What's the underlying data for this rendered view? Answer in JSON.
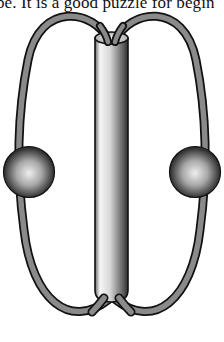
{
  "caption": {
    "text": "be. It is a good puzzle for begin"
  },
  "figure": {
    "elements": [
      {
        "name": "tube",
        "description": "vertical hollow cylinder"
      },
      {
        "name": "left-loop",
        "description": "string loop passing through tube"
      },
      {
        "name": "right-loop",
        "description": "string loop passing through tube"
      },
      {
        "name": "left-bead",
        "description": "sphere on left loop"
      },
      {
        "name": "right-bead",
        "description": "sphere on right loop"
      }
    ],
    "colors": {
      "background": "#ffffff",
      "outline": "#111111",
      "string_fill": "#8a8a8a",
      "tube_light": "#f2f2f2",
      "tube_dark": "#3a3a3a",
      "bead_light": "#e8e8e8",
      "bead_dark": "#1a1a1a"
    }
  }
}
